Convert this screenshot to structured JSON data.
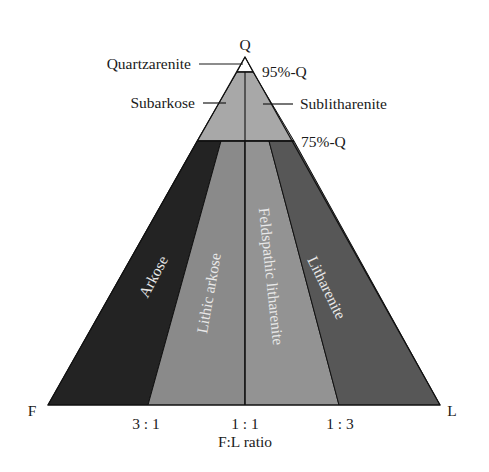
{
  "vertices": {
    "top": "Q",
    "left": "F",
    "right": "L"
  },
  "thresholds": {
    "upper": "95%-Q",
    "lower": "75%-Q"
  },
  "upper_fields": {
    "apex": "Quartzarenite",
    "left": "Subarkose",
    "right": "Sublitharenite"
  },
  "lower_fields": [
    {
      "label": "Arkose",
      "color": "#232323"
    },
    {
      "label": "Lithic arkose",
      "color": "#8a8a8a"
    },
    {
      "label": "Feldspathic litharenite",
      "color": "#939393"
    },
    {
      "label": "Litharenite",
      "color": "#575757"
    }
  ],
  "upper_field_color": "#a8a8a8",
  "apex_field_color": "#ffffff",
  "axis": {
    "ticks": [
      "3 : 1",
      "1 : 1",
      "1 : 3"
    ],
    "label": "F:L ratio"
  }
}
